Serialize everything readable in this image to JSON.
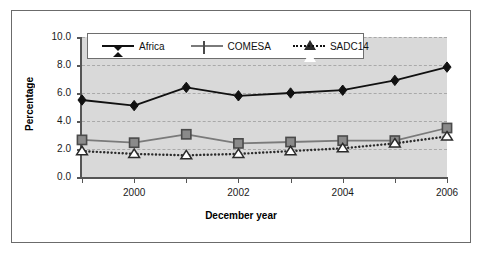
{
  "chart_data": {
    "type": "line",
    "title": "",
    "xlabel": "December year",
    "ylabel": "Percentage",
    "x": [
      1999,
      2000,
      2001,
      2002,
      2003,
      2004,
      2005,
      2006
    ],
    "xtick_labels": [
      "",
      "2000",
      "",
      "2002",
      "",
      "2004",
      "",
      "2006"
    ],
    "ytick_labels": [
      "0.0",
      "2.0",
      "4.0",
      "6.0",
      "8.0",
      "10.0"
    ],
    "ytick_values": [
      0.0,
      2.0,
      4.0,
      6.0,
      8.0,
      10.0
    ],
    "xlim": [
      1999,
      2006
    ],
    "ylim": [
      0.0,
      10.0
    ],
    "grid": "horizontal-dashed",
    "legend_position": "top-inside",
    "plot_background": "#d9d9d9",
    "series": [
      {
        "name": "Africa",
        "marker": "filled-diamond",
        "line_style": "solid",
        "color": "#111111",
        "values": [
          5.5,
          5.1,
          6.4,
          5.8,
          6.0,
          6.2,
          6.9,
          7.85
        ]
      },
      {
        "name": "COMESA",
        "marker": "filled-square",
        "line_style": "solid",
        "color": "#7a7a7a",
        "values": [
          2.65,
          2.45,
          3.05,
          2.4,
          2.5,
          2.6,
          2.6,
          3.5
        ]
      },
      {
        "name": "SADC14",
        "marker": "open-triangle",
        "line_style": "dotted",
        "color": "#2b2b2b",
        "values": [
          1.85,
          1.65,
          1.55,
          1.65,
          1.85,
          2.05,
          2.4,
          2.9
        ]
      }
    ]
  },
  "axes": {
    "ylabel": "Percentage",
    "xlabel": "December year",
    "ytick_labels": [
      "10.0",
      "8.0",
      "6.0",
      "4.0",
      "2.0",
      "0.0"
    ],
    "xtick_labels": [
      "2000",
      "2002",
      "2004",
      "2006"
    ]
  },
  "legend": {
    "entries": [
      {
        "label": "Africa",
        "marker": "filled-diamond",
        "line": "solid"
      },
      {
        "label": "COMESA",
        "marker": "filled-square",
        "line": "solid"
      },
      {
        "label": "SADC14",
        "marker": "open-triangle",
        "line": "dotted"
      }
    ]
  }
}
